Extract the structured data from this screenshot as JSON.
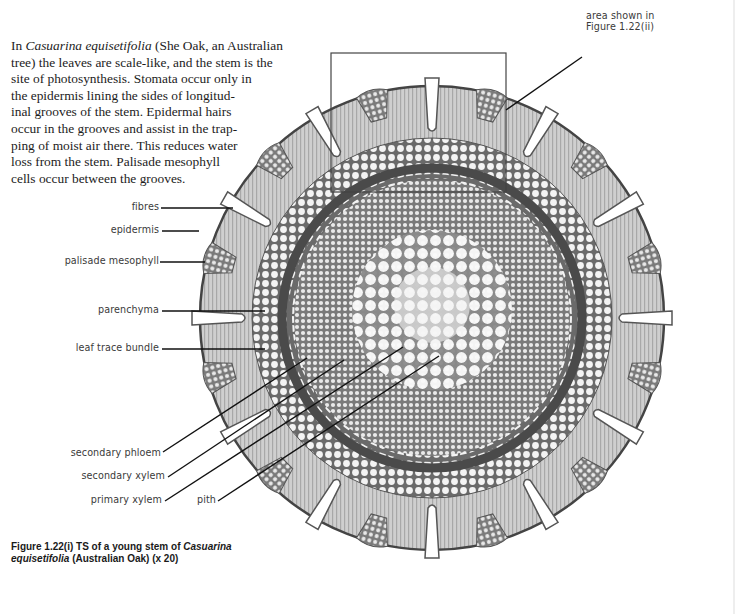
{
  "intro": {
    "lines": [
      {
        "pre": "In ",
        "italic": "Casuarina equisetifolia",
        "post": " (She Oak, an Australian"
      },
      {
        "pre": "tree) the leaves are scale-like, and the stem is the",
        "italic": "",
        "post": ""
      },
      {
        "pre": "site of photosynthesis. Stomata occur only in",
        "italic": "",
        "post": ""
      },
      {
        "pre": "the epidermis lining the sides of longitud-",
        "italic": "",
        "post": ""
      },
      {
        "pre": "inal grooves of the stem. Epidermal hairs",
        "italic": "",
        "post": ""
      },
      {
        "pre": "occur in the grooves and assist in the trap-",
        "italic": "",
        "post": ""
      },
      {
        "pre": "ping of moist air there. This reduces water",
        "italic": "",
        "post": ""
      },
      {
        "pre": "loss from the stem. Palisade mesophyll",
        "italic": "",
        "post": ""
      },
      {
        "pre": "cells occur between the grooves.",
        "italic": "",
        "post": ""
      }
    ]
  },
  "inset_box": {
    "label_line1": "area shown in",
    "label_line2": "Figure 1.22(ii)",
    "x": 331,
    "y": 53,
    "width": 175,
    "height": 139
  },
  "labels": {
    "fibres": "fibres",
    "epidermis": "epidermis",
    "palisade_mesophyll": "palisade mesophyll",
    "parenchyma": "parenchyma",
    "leaf_trace_bundle": "leaf trace bundle",
    "secondary_phloem": "secondary phloem",
    "secondary_xylem": "secondary xylem",
    "primary_xylem": "primary xylem",
    "pith": "pith"
  },
  "caption": {
    "figure": "Figure 1.22(i)",
    "text_pre": " TS of a young stem of ",
    "italic1": "Casuarina",
    "italic2": "equisetifolia",
    "text_post": " (Australian Oak) (x 20)"
  },
  "colors": {
    "ink": "#1c1c1c",
    "label_gray": "#3a3a3a",
    "tissue_light": "#c9c9c9",
    "tissue_mid": "#9a9a9a",
    "tissue_dark": "#4a4a4a"
  }
}
